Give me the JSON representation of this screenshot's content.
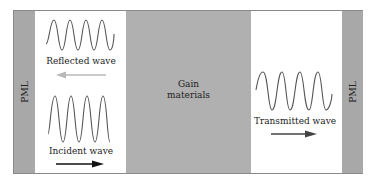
{
  "diagram": {
    "regions": [
      {
        "name": "PML",
        "type": "pml",
        "label": "PML"
      },
      {
        "name": "left-vacuum",
        "type": "white"
      },
      {
        "name": "gain",
        "type": "gain",
        "label_lines": [
          "Gain",
          "materials"
        ]
      },
      {
        "name": "right-vacuum",
        "type": "white"
      },
      {
        "name": "PML",
        "type": "pml",
        "label": "PML"
      }
    ],
    "left_pml_label": "PML",
    "right_pml_label": "PML",
    "gain_label_line1": "Gain",
    "gain_label_line2": "materials",
    "reflected_wave_label": "Reflected wave",
    "incident_wave_label": "Incident wave",
    "transmitted_wave_label": "Transmitted wave",
    "colors": {
      "pml": "#a8a8a8",
      "gain": "#b0b0b0",
      "wave": "#555555",
      "reflected_arrow": "#b8b8b8",
      "incident_arrow": "#111111",
      "transmitted_arrow": "#444444"
    }
  }
}
